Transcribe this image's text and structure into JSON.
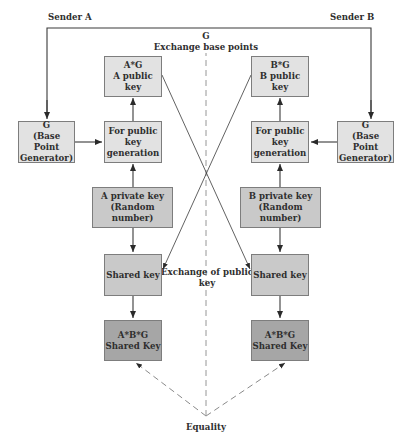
{
  "diagram": {
    "title_left": "Sender A",
    "title_right": "Sender B",
    "center_top_label": "G\nExchange base points",
    "center_mid_label": "Exchange of public\nkey",
    "bottom_label": "Equality",
    "left": {
      "public_key": "A*G\nA public key",
      "base_point": "G\n(Base Point\nGenerator)",
      "key_generation": "For public\nkey\ngeneration",
      "private_key": "A private key\n(Random number)",
      "shared_key": "Shared key",
      "final_key": "A*B*G\nShared Key"
    },
    "right": {
      "public_key": "B*G\nB public key",
      "base_point": "G\n(Base Point\nGenerator)",
      "key_generation": "For public\nkey\ngeneration",
      "private_key": "B private key\n(Random number)",
      "shared_key": "Shared key",
      "final_key": "A*B*G\nShared Key"
    },
    "colors": {
      "light_box": "#e2e2e2",
      "mid_box": "#c9c9c9",
      "dark_box": "#a6a6a6",
      "line": "#3a3a3a",
      "dashed": "#8a8a8a"
    }
  }
}
